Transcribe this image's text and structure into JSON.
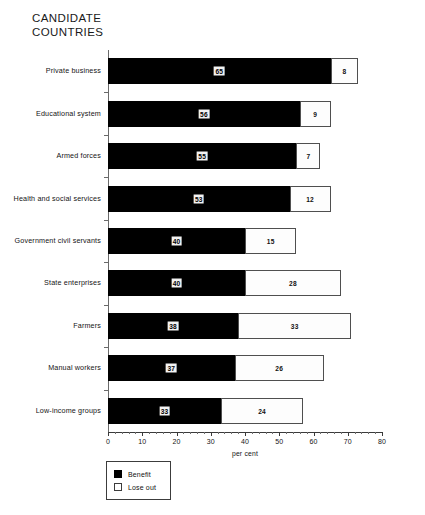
{
  "title": {
    "line1": "CANDIDATE",
    "line2": "COUNTRIES"
  },
  "axis": {
    "xlabel": "per cent",
    "ticks": [
      "0",
      "10",
      "20",
      "30",
      "40",
      "50",
      "60",
      "70",
      "80"
    ]
  },
  "legend": {
    "benefit_label": "Benefit",
    "lose_label": "Lose out"
  },
  "chart_data": {
    "type": "bar",
    "orientation": "horizontal",
    "stacked": true,
    "title": "CANDIDATE COUNTRIES",
    "xlabel": "per cent",
    "ylabel": "",
    "xlim": [
      0,
      80
    ],
    "xticks": [
      0,
      10,
      20,
      30,
      40,
      50,
      60,
      70,
      80
    ],
    "grid": false,
    "legend_position": "bottom-left",
    "categories": [
      "Private business",
      "Educational system",
      "Armed forces",
      "Health and social services",
      "Government civil servants",
      "State enterprises",
      "Farmers",
      "Manual workers",
      "Low-income groups"
    ],
    "series": [
      {
        "name": "Benefit",
        "color": "#000000",
        "values": [
          65,
          56,
          55,
          53,
          40,
          40,
          38,
          37,
          33
        ]
      },
      {
        "name": "Lose out",
        "color": "#ffffff",
        "values": [
          8,
          9,
          7,
          12,
          15,
          28,
          33,
          26,
          24
        ]
      }
    ],
    "rows": [
      {
        "category": "Private business",
        "benefit": 65,
        "lose_out": 8
      },
      {
        "category": "Educational system",
        "benefit": 56,
        "lose_out": 9
      },
      {
        "category": "Armed forces",
        "benefit": 55,
        "lose_out": 7
      },
      {
        "category": "Health and social services",
        "benefit": 53,
        "lose_out": 12
      },
      {
        "category": "Government civil servants",
        "benefit": 40,
        "lose_out": 15
      },
      {
        "category": "State enterprises",
        "benefit": 40,
        "lose_out": 28
      },
      {
        "category": "Farmers",
        "benefit": 38,
        "lose_out": 33
      },
      {
        "category": "Manual workers",
        "benefit": 37,
        "lose_out": 26
      },
      {
        "category": "Low-income groups",
        "benefit": 33,
        "lose_out": 24
      }
    ]
  }
}
